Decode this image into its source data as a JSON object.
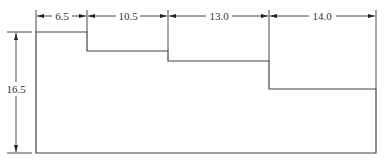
{
  "diagram": {
    "type": "stepped-profile",
    "horizontal_dimensions": [
      {
        "label": "6.5",
        "x_start": 36,
        "x_end": 87
      },
      {
        "label": "10.5",
        "x_start": 87,
        "x_end": 168
      },
      {
        "label": "13.0",
        "x_start": 168,
        "x_end": 269
      },
      {
        "label": "14.0",
        "x_start": 269,
        "x_end": 376
      }
    ],
    "vertical_dimension": {
      "label": "16.5",
      "y_start": 32,
      "y_end": 153
    },
    "step_heights_px": [
      32,
      51,
      61,
      89
    ],
    "baseline_y": 153,
    "colors": {
      "line": "#444444",
      "text": "#333333",
      "background": "#ffffff"
    }
  }
}
